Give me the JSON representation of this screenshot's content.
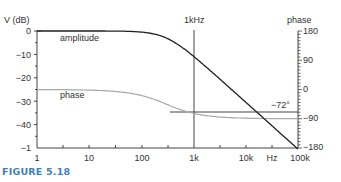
{
  "chart_data": {
    "type": "line",
    "title": "",
    "xlabel": "Hz",
    "ylabel": "V (dB)",
    "ylabel_right": "phase",
    "xscale": "log",
    "x_ticks": [
      "1",
      "10",
      "100",
      "1k",
      "10k",
      "100k"
    ],
    "x_tick_values": [
      1,
      10,
      100,
      1000,
      10000,
      100000
    ],
    "y_ticks": [
      "0",
      "−10",
      "−20",
      "−30",
      "−40",
      "−1"
    ],
    "y_tick_values": [
      0,
      -10,
      -20,
      -30,
      -40,
      -50
    ],
    "ylim": [
      -50,
      0
    ],
    "y2_ticks": [
      "180",
      "90",
      "0",
      "−90",
      "−180"
    ],
    "y2_tick_values": [
      180,
      90,
      0,
      -90,
      -180
    ],
    "y2lim": [
      -180,
      180
    ],
    "grid": false,
    "series": [
      {
        "name": "amplitude",
        "axis": "left",
        "x": [
          1,
          10,
          30,
          100,
          200,
          300,
          500,
          1000,
          3000,
          10000,
          30000,
          100000
        ],
        "values": [
          0,
          0,
          0,
          -0.4,
          -1.6,
          -3,
          -5.7,
          -10.4,
          -20,
          -30.5,
          -40,
          -50.5
        ]
      },
      {
        "name": "phase",
        "axis": "right",
        "x": [
          1,
          10,
          30,
          100,
          200,
          300,
          500,
          1000,
          3000,
          10000,
          30000,
          100000
        ],
        "values": [
          0,
          -2,
          -6,
          -18,
          -34,
          -45,
          -59,
          -72,
          -84,
          -88,
          -89,
          -90
        ]
      }
    ],
    "annotations": [
      {
        "type": "vline",
        "x": 1000,
        "label": "1kHz"
      },
      {
        "type": "hline",
        "axis": "right",
        "y": -72,
        "label": "−72°",
        "x_start": 300
      }
    ],
    "legend": "inline labels"
  },
  "labels": {
    "ylabel": "V (dB)",
    "y2label": "phase",
    "vline_label": "1kHz",
    "amplitude": "amplitude",
    "phase": "phase",
    "hline_label": "−72°",
    "hz": "Hz",
    "x0": "1",
    "x1": "10",
    "x2": "100",
    "x3": "1k",
    "x4": "10k",
    "x5": "100k",
    "y0": "0",
    "y1": "−10",
    "y2": "−20",
    "y3": "−30",
    "y4": "−40",
    "y5": "−1",
    "p0": "180",
    "p1": "90",
    "p2": "0",
    "p3": "−90",
    "p4": "−180"
  },
  "caption": "FIGURE 5.18",
  "colors": {
    "amplitude": "#222222",
    "phase": "#a8a8a8",
    "axes": "#444444",
    "caption": "#3f7fb8"
  }
}
